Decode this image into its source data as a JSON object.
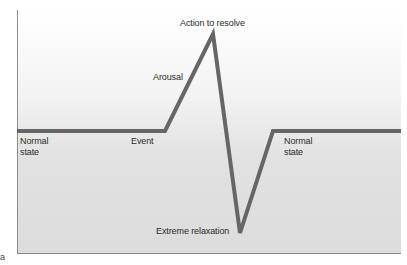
{
  "diagram": {
    "type": "stress-response-curve",
    "line_color": "#666666",
    "labels": {
      "normal_state_left": "Normal state",
      "event": "Event",
      "arousal": "Arousal",
      "action_to_resolve": "Action to resolve",
      "extreme_relaxation": "Extreme relaxation",
      "normal_state_right": "Normal state"
    },
    "figure_letter": "a",
    "points": [
      {
        "x": 17,
        "y": 131
      },
      {
        "x": 165,
        "y": 131
      },
      {
        "x": 213,
        "y": 34
      },
      {
        "x": 240,
        "y": 233
      },
      {
        "x": 273,
        "y": 131
      },
      {
        "x": 401,
        "y": 131
      }
    ]
  }
}
